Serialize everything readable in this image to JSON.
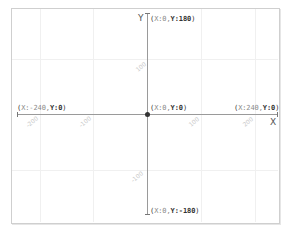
{
  "plane": {
    "x_axis_label": "X",
    "y_axis_label": "Y",
    "colors": {
      "axis": "#9a9a9a",
      "grid": "#f0f0f0",
      "frame": "#cfcfcf",
      "tick_label": "#c8c8c8",
      "coord_text": "#333333",
      "origin_dot": "#333333"
    },
    "points": {
      "top": {
        "open": "(",
        "xk": "X:0,",
        "yk": "Y:180",
        "close": ")"
      },
      "bottom": {
        "open": "(",
        "xk": "X:0,",
        "yk": "Y:-180",
        "close": ")"
      },
      "left": {
        "open": "(",
        "xk": "X:-240,",
        "yk": "Y:0",
        "close": ")"
      },
      "right": {
        "open": "(",
        "xk": "X:240,",
        "yk": "Y:0",
        "close": ")"
      },
      "origin": {
        "open": "(",
        "xk": "X:0,",
        "yk": "Y:0",
        "close": ")"
      }
    },
    "x_ticks": [
      "-200",
      "-100",
      "100",
      "200"
    ],
    "y_ticks": [
      "100",
      "-100"
    ],
    "x_range": [
      -240,
      240
    ],
    "y_range": [
      -180,
      180
    ]
  }
}
